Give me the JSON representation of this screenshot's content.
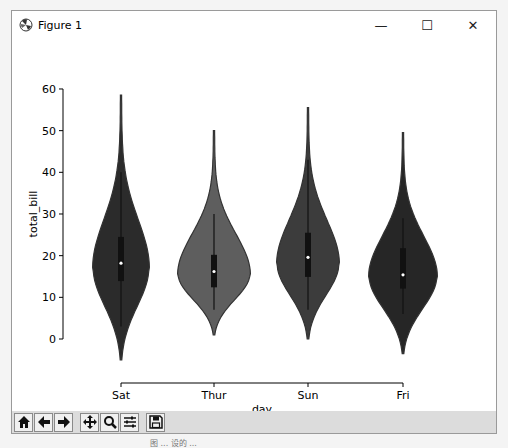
{
  "window": {
    "title": "Figure 1",
    "controls": {
      "minimize": "—",
      "maximize": "☐",
      "close": "✕"
    }
  },
  "toolbar": {
    "buttons": [
      {
        "name": "home",
        "icon": "home-icon"
      },
      {
        "name": "back",
        "icon": "arrow-left-icon"
      },
      {
        "name": "forward",
        "icon": "arrow-right-icon"
      },
      {
        "name": "pan",
        "icon": "move-icon"
      },
      {
        "name": "zoom",
        "icon": "magnifier-icon"
      },
      {
        "name": "configure-subplots",
        "icon": "sliders-icon"
      },
      {
        "name": "save",
        "icon": "floppy-disk-icon"
      }
    ]
  },
  "caption": "图 ... 设的 ...",
  "chart_data": {
    "type": "violin",
    "title": "",
    "xlabel": "day",
    "ylabel": "total_bill",
    "categories": [
      "Sat",
      "Thur",
      "Sun",
      "Fri"
    ],
    "yticks": [
      0,
      10,
      20,
      30,
      40,
      50,
      60
    ],
    "ylim": [
      -5,
      60
    ],
    "grid": false,
    "legend": null,
    "colors": {
      "Sat": "#2b2b2b",
      "Thur": "#5e5e5e",
      "Sun": "#3c3c3c",
      "Fri": "#262626"
    },
    "series": [
      {
        "name": "Sat",
        "min_kde": -5,
        "max_kde": 58.5,
        "whisker_low": 3,
        "q1": 13.9,
        "median": 18.2,
        "q3": 24.5,
        "whisker_high": 40,
        "mode": 17,
        "halfwidth": 27
      },
      {
        "name": "Thur",
        "min_kde": 1,
        "max_kde": 50,
        "whisker_low": 7,
        "q1": 12.4,
        "median": 16.2,
        "q3": 20.2,
        "whisker_high": 30,
        "mode": 15.5,
        "halfwidth": 35
      },
      {
        "name": "Sun",
        "min_kde": 0,
        "max_kde": 55.5,
        "whisker_low": 7,
        "q1": 14.9,
        "median": 19.6,
        "q3": 25.5,
        "whisker_high": 43,
        "mode": 18,
        "halfwidth": 30
      },
      {
        "name": "Fri",
        "min_kde": -3.5,
        "max_kde": 49.5,
        "whisker_low": 6,
        "q1": 12.1,
        "median": 15.4,
        "q3": 21.8,
        "whisker_high": 29,
        "mode": 15,
        "halfwidth": 33
      }
    ]
  }
}
